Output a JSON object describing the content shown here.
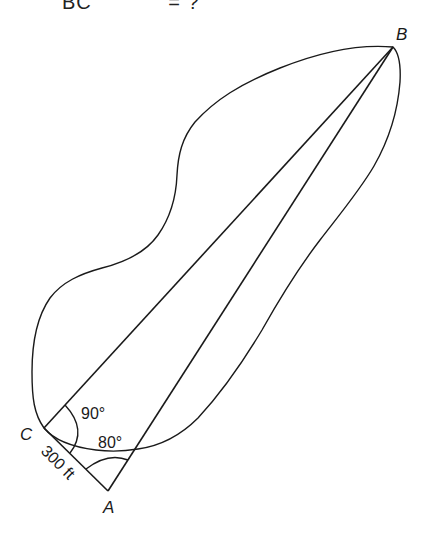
{
  "header": {
    "cropped_text_left": "BC",
    "cropped_text_right": "= ?"
  },
  "diagram": {
    "type": "surveying-triangle",
    "points": {
      "A": {
        "label": "A",
        "x": 108,
        "y": 491
      },
      "B": {
        "label": "B",
        "x": 393,
        "y": 47
      },
      "C": {
        "label": "C",
        "x": 44,
        "y": 428
      }
    },
    "angles": {
      "C": {
        "label": "90°"
      },
      "A": {
        "label": "80°"
      }
    },
    "segments": {
      "CA": {
        "label": "300 ft"
      }
    },
    "boundary": "irregular closed outline (lake/obstacle) enclosing line CB and AB",
    "stroke_color": "#1a1a1a",
    "background_color": "#ffffff"
  }
}
